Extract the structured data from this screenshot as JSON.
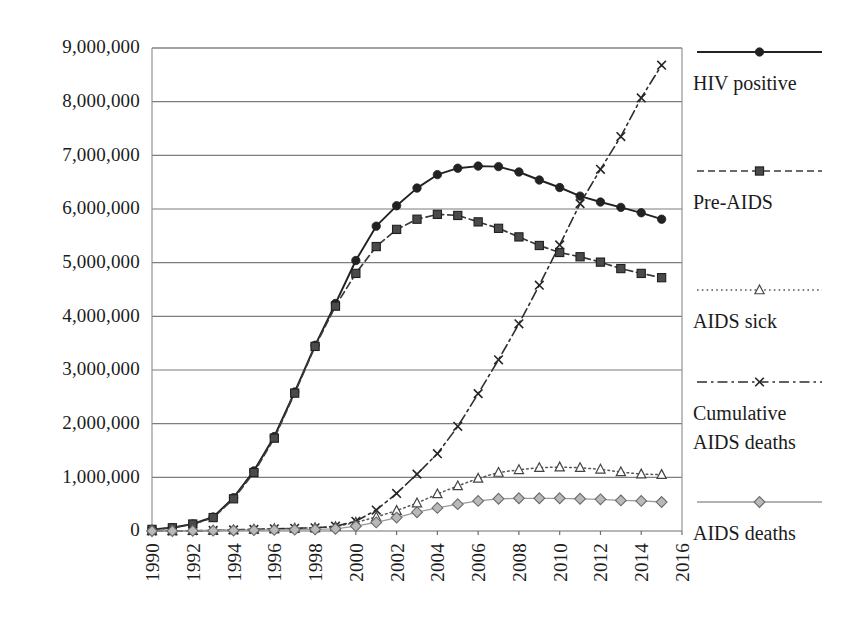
{
  "chart_data": {
    "type": "line",
    "title": "",
    "subtitle": "",
    "xlabel": "",
    "ylabel": "",
    "xlim": [
      1990,
      2016
    ],
    "ylim": [
      0,
      9000000
    ],
    "grid": true,
    "legend_position": "right",
    "x": [
      1990,
      1991,
      1992,
      1993,
      1994,
      1995,
      1996,
      1997,
      1998,
      1999,
      2000,
      2001,
      2002,
      2003,
      2004,
      2005,
      2006,
      2007,
      2008,
      2009,
      2010,
      2011,
      2012,
      2013,
      2014,
      2015
    ],
    "x_tick_labels": [
      "1990",
      "1992",
      "1994",
      "1996",
      "1998",
      "2000",
      "2002",
      "2004",
      "2006",
      "2008",
      "2010",
      "2012",
      "2014",
      "2016"
    ],
    "y_tick_labels": [
      "0",
      "1,000,000",
      "2,000,000",
      "3,000,000",
      "4,000,000",
      "5,000,000",
      "6,000,000",
      "7,000,000",
      "8,000,000",
      "9,000,000"
    ],
    "y_tick_values": [
      0,
      1000000,
      2000000,
      3000000,
      4000000,
      5000000,
      6000000,
      7000000,
      8000000,
      9000000
    ],
    "series": [
      {
        "name": "HIV positive",
        "marker": "circle",
        "line_style": "solid",
        "color": "#222222",
        "values": [
          30000,
          60000,
          130000,
          260000,
          620000,
          1120000,
          1760000,
          2590000,
          3460000,
          4240000,
          5040000,
          5680000,
          6060000,
          6390000,
          6640000,
          6760000,
          6800000,
          6790000,
          6690000,
          6540000,
          6400000,
          6240000,
          6130000,
          6030000,
          5930000,
          5810000
        ]
      },
      {
        "name": "Pre-AIDS",
        "marker": "square",
        "line_style": "dashed",
        "color": "#3b3b3b",
        "values": [
          30000,
          60000,
          130000,
          250000,
          600000,
          1090000,
          1730000,
          2570000,
          3440000,
          4190000,
          4800000,
          5300000,
          5620000,
          5810000,
          5900000,
          5880000,
          5760000,
          5640000,
          5480000,
          5320000,
          5190000,
          5110000,
          5010000,
          4890000,
          4800000,
          4720000
        ]
      },
      {
        "name": "AIDS sick",
        "marker": "triangle",
        "line_style": "dotted",
        "color": "#555555",
        "values": [
          0,
          0,
          5000,
          10000,
          20000,
          30000,
          40000,
          50000,
          60000,
          80000,
          160000,
          260000,
          380000,
          520000,
          690000,
          840000,
          980000,
          1090000,
          1140000,
          1180000,
          1190000,
          1180000,
          1150000,
          1100000,
          1060000,
          1050000
        ]
      },
      {
        "name": "Cumulative AIDS deaths",
        "marker": "x",
        "line_style": "dash-dot",
        "color": "#2e2e2e",
        "values": [
          0,
          0,
          5000,
          10000,
          20000,
          30000,
          40000,
          50000,
          60000,
          90000,
          180000,
          390000,
          700000,
          1060000,
          1440000,
          1950000,
          2560000,
          3190000,
          3860000,
          4580000,
          5330000,
          6100000,
          6740000,
          7350000,
          8070000,
          8680000
        ]
      },
      {
        "name": "AIDS deaths",
        "marker": "diamond",
        "line_style": "solid-light",
        "color": "#9a9a9a",
        "values": [
          0,
          0,
          3000,
          6000,
          10000,
          15000,
          20000,
          25000,
          30000,
          40000,
          90000,
          160000,
          250000,
          350000,
          430000,
          500000,
          560000,
          600000,
          610000,
          610000,
          610000,
          600000,
          590000,
          570000,
          560000,
          540000
        ]
      }
    ]
  },
  "legend": {
    "entries": [
      {
        "label": "HIV positive",
        "marker": "circle",
        "line_style": "solid"
      },
      {
        "label": "Pre-AIDS",
        "marker": "square",
        "line_style": "dashed"
      },
      {
        "label": "AIDS sick",
        "marker": "triangle",
        "line_style": "dotted"
      },
      {
        "label": "Cumulative",
        "label2": "AIDS deaths",
        "marker": "x",
        "line_style": "dash-dot"
      },
      {
        "label": "AIDS deaths",
        "marker": "diamond",
        "line_style": "solid-light"
      }
    ]
  }
}
